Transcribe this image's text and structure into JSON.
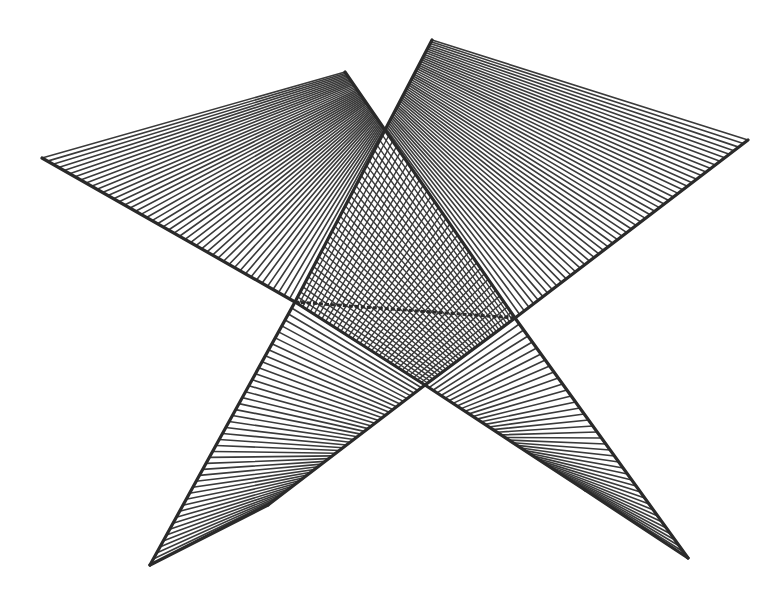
{
  "figure": {
    "colors": {
      "ink": "#3a3a3a",
      "background": "#ffffff",
      "edge": "#2a2a2a"
    },
    "vertices": {
      "left_wing_outer": [
        42,
        158
      ],
      "left_wing_top": [
        345,
        72
      ],
      "apex_top": [
        385,
        130
      ],
      "right_wing_top": [
        432,
        40
      ],
      "right_wing_outer": [
        748,
        140
      ],
      "left_junction": [
        295,
        302
      ],
      "right_junction": [
        515,
        318
      ],
      "center_bottom": [
        425,
        385
      ],
      "left_spike_tip": [
        150,
        565
      ],
      "left_spike_inner": [
        268,
        505
      ],
      "right_spike_tip": [
        688,
        558
      ],
      "right_spike_inner": [
        585,
        490
      ]
    },
    "panels": [
      {
        "name": "left-wing",
        "a1": [
          42,
          158
        ],
        "a2": [
          295,
          302
        ],
        "b1": [
          345,
          72
        ],
        "b2": [
          385,
          130
        ],
        "count": 46
      },
      {
        "name": "right-wing",
        "a1": [
          432,
          40
        ],
        "a2": [
          385,
          130
        ],
        "b1": [
          748,
          140
        ],
        "b2": [
          515,
          318
        ],
        "count": 50
      },
      {
        "name": "left-spike",
        "a1": [
          295,
          302
        ],
        "a2": [
          150,
          565
        ],
        "b1": [
          425,
          385
        ],
        "b2": [
          268,
          505
        ],
        "count": 44
      },
      {
        "name": "right-spike",
        "a1": [
          515,
          318
        ],
        "a2": [
          688,
          558
        ],
        "b1": [
          425,
          385
        ],
        "b2": [
          585,
          490
        ],
        "count": 40
      }
    ],
    "mesh": {
      "top": [
        385,
        130
      ],
      "left": [
        295,
        302
      ],
      "right": [
        515,
        318
      ],
      "bottom": [
        425,
        385
      ],
      "count": 34
    }
  }
}
